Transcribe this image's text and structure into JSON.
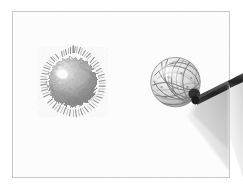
{
  "canvas": {
    "width": 243,
    "height": 190,
    "background_color": "#ffffff",
    "type": "grayscale-photograph"
  },
  "frame": {
    "name": "image-border",
    "x": 12,
    "y": 11,
    "width": 218,
    "height": 167,
    "border_color": "#c9c9c9",
    "border_width": 1,
    "fill_color": "#fdfdfd"
  },
  "scene": {
    "description": "Grayscale photograph of two spherical objects on a plain white background",
    "object_count": 2,
    "palette": {
      "background": "#ffffff",
      "frame_line": "#c9c9c9",
      "sphere_mid": "#9a9a9a",
      "sphere_dark": "#6e6e6e",
      "sphere_light": "#d8d8d8",
      "highlight": "#ffffff",
      "rod_dark": "#2b2b2b",
      "rod_mid": "#555555",
      "shadow_gray": "#b8b8b8"
    }
  },
  "objects": [
    {
      "id": "left-sphere",
      "label": "fuzzy spiky sphere",
      "shape": "sphere",
      "surface": "fuzzy-spiked",
      "center_x": 62,
      "center_y": 82,
      "radius": 26,
      "base_color": "#9a9a9a",
      "highlight_color": "#ffffff",
      "highlight_x": 54,
      "highlight_y": 72,
      "shadow_color": "#6f6f6f",
      "spike_count": 120,
      "spike_length_min": 2,
      "spike_length_max": 6
    },
    {
      "id": "right-sphere",
      "label": "crumpled wireframe ball",
      "shape": "sphere",
      "surface": "crumpled-wire-mesh",
      "center_x": 176,
      "center_y": 82,
      "radius": 25,
      "base_color": "#e2e2e2",
      "line_color": "#5d5d5d",
      "highlight_color": "#fbfbfb",
      "highlight_x": 168,
      "highlight_y": 70,
      "shadow_color": "#8a8a8a",
      "strand_count": 26
    },
    {
      "id": "support-rod",
      "label": "dark angled rod holding the right sphere",
      "shape": "rod",
      "from_x": 194,
      "from_y": 95,
      "to_x": 243,
      "to_y": 78,
      "thickness": 9,
      "color_dark": "#2b2b2b",
      "color_mid": "#555555"
    },
    {
      "id": "rod-shadow",
      "label": "soft gray shadow cone below the rod",
      "shape": "cone",
      "apex_x": 196,
      "apex_y": 99,
      "spread_to_x": 243,
      "spread_to_y": 165,
      "color": "#b8b8b8",
      "opacity": 0.55
    }
  ]
}
